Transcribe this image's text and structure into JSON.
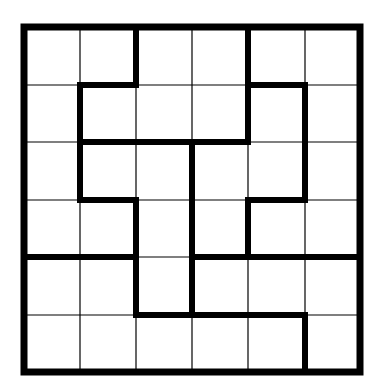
{
  "puzzle": {
    "type": "region-division grid",
    "rows": 6,
    "cols": 6,
    "origin": [
      24,
      27
    ],
    "col_lines": [
      24,
      80,
      136,
      192,
      248,
      305,
      360
    ],
    "row_lines": [
      27,
      85,
      142,
      200,
      257,
      315,
      372
    ],
    "colors": {
      "background": "#ffffff",
      "thin_line": "#000000",
      "thick_line": "#000000"
    },
    "thin_width": 1.2,
    "thick_width": 6,
    "thick_segments": [
      {
        "x1": 136,
        "y1": 27,
        "x2": 136,
        "y2": 85
      },
      {
        "x1": 80,
        "y1": 85,
        "x2": 136,
        "y2": 85
      },
      {
        "x1": 80,
        "y1": 85,
        "x2": 80,
        "y2": 200
      },
      {
        "x1": 248,
        "y1": 27,
        "x2": 248,
        "y2": 142
      },
      {
        "x1": 248,
        "y1": 85,
        "x2": 305,
        "y2": 85
      },
      {
        "x1": 305,
        "y1": 85,
        "x2": 305,
        "y2": 200
      },
      {
        "x1": 80,
        "y1": 142,
        "x2": 248,
        "y2": 142
      },
      {
        "x1": 192,
        "y1": 142,
        "x2": 192,
        "y2": 315
      },
      {
        "x1": 80,
        "y1": 200,
        "x2": 136,
        "y2": 200
      },
      {
        "x1": 136,
        "y1": 200,
        "x2": 136,
        "y2": 315
      },
      {
        "x1": 248,
        "y1": 200,
        "x2": 305,
        "y2": 200
      },
      {
        "x1": 248,
        "y1": 200,
        "x2": 248,
        "y2": 257
      },
      {
        "x1": 24,
        "y1": 257,
        "x2": 136,
        "y2": 257
      },
      {
        "x1": 192,
        "y1": 257,
        "x2": 360,
        "y2": 257
      },
      {
        "x1": 136,
        "y1": 315,
        "x2": 305,
        "y2": 315
      },
      {
        "x1": 305,
        "y1": 315,
        "x2": 305,
        "y2": 372
      }
    ]
  }
}
